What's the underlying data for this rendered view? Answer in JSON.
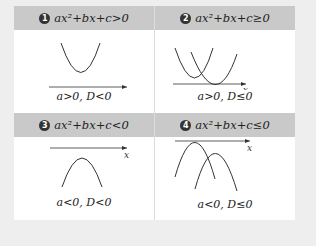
{
  "cells": [
    {
      "num": "1",
      "inequality": "ax²+bx+c>0",
      "condition": "a>0,  D<0",
      "axis_label": "x"
    },
    {
      "num": "2",
      "inequality": "ax²+bx+c≥0",
      "condition": "a>0,  D≤0",
      "axis_label": "x"
    },
    {
      "num": "3",
      "inequality": "ax²+bx+c<0",
      "condition": "a<0,  D<0",
      "axis_label": "x"
    },
    {
      "num": "4",
      "inequality": "ax²+bx+c≤0",
      "condition": "a<0,  D≤0",
      "axis_label": "x"
    }
  ]
}
